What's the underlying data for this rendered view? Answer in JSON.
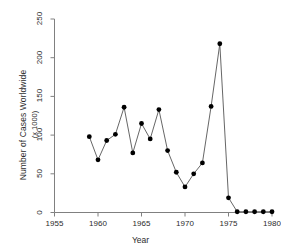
{
  "chart_data": {
    "type": "line",
    "title": "",
    "xlabel": "Year",
    "ylabel": "Number of Cases Worldwide",
    "ylabel_sub": "(x 1000)",
    "xlim": [
      1955,
      1980
    ],
    "ylim": [
      0,
      250
    ],
    "grid": false,
    "legend": null,
    "marker": "filled-circle",
    "xticks": [
      1955,
      1960,
      1965,
      1970,
      1975,
      1980
    ],
    "xtick_labels": [
      "1955",
      "1960",
      "1965",
      "1970",
      "1975",
      "1980"
    ],
    "yticks": [
      0,
      50,
      100,
      150,
      200,
      250
    ],
    "ytick_labels": [
      "0",
      "50",
      "100",
      "150",
      "200",
      "250"
    ],
    "x": [
      1959,
      1960,
      1961,
      1962,
      1963,
      1964,
      1965,
      1966,
      1967,
      1968,
      1969,
      1970,
      1971,
      1972,
      1973,
      1974,
      1975,
      1976,
      1977,
      1978,
      1979,
      1980
    ],
    "values": [
      98,
      68,
      93,
      101,
      136,
      77,
      115,
      95,
      133,
      80,
      52,
      33,
      50,
      64,
      137,
      218,
      19,
      1,
      1,
      1,
      1,
      1
    ],
    "series": [
      {
        "name": "Cases",
        "values": [
          98,
          68,
          93,
          101,
          136,
          77,
          115,
          95,
          133,
          80,
          52,
          33,
          50,
          64,
          137,
          218,
          19,
          1,
          1,
          1,
          1,
          1
        ]
      }
    ],
    "line_color": "#555555",
    "marker_color": "#000000",
    "axis_color": "#808080"
  },
  "axes": {
    "x_axis_label": "Year",
    "y_axis_label_line1": "Number of Cases Worldwide",
    "y_axis_label_line2": "(x 1000)"
  }
}
